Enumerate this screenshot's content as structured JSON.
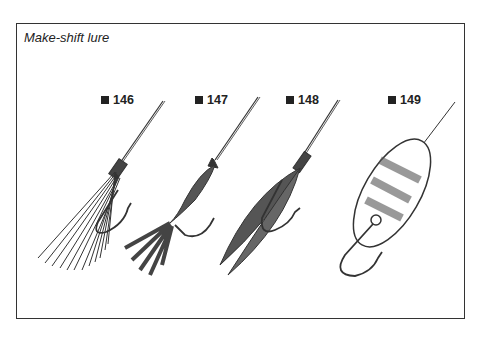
{
  "figure": {
    "title": "Make-shift lure",
    "items": [
      {
        "number": "146",
        "description": "thread/hair tassel lure on hook"
      },
      {
        "number": "147",
        "description": "cloth strip lure tied on hook"
      },
      {
        "number": "148",
        "description": "feather lure on hook"
      },
      {
        "number": "149",
        "description": "spoon lure with hook"
      }
    ]
  }
}
